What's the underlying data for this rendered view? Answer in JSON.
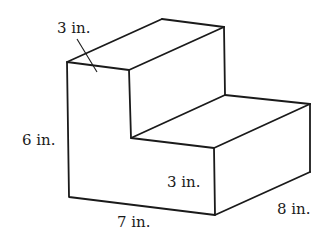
{
  "diagram": {
    "type": "3d-solid-step-shape",
    "labels": {
      "top_width": "3 in.",
      "height": "6 in.",
      "step_height": "3 in.",
      "length": "7 in.",
      "depth": "8 in."
    },
    "colors": {
      "line": "#1a1a1a",
      "background": "#ffffff"
    }
  }
}
